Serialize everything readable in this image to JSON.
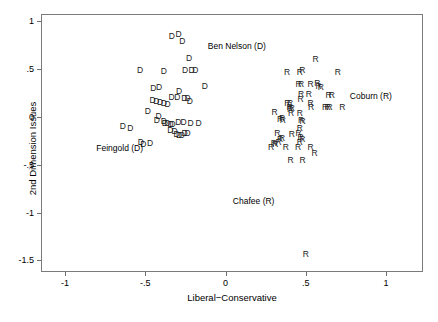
{
  "chart_data": {
    "type": "scatter",
    "title": "",
    "xlabel": "Liberal−Conservative",
    "ylabel": "2nd Dimension Issues",
    "xlim": [
      -1.15,
      1.23
    ],
    "ylim": [
      -1.62,
      1.07
    ],
    "grid": false,
    "legend": false,
    "xticks": [
      -1,
      -0.5,
      0,
      0.5,
      1
    ],
    "xticklabels": [
      "-1",
      "-.5",
      "0",
      ".5",
      "1"
    ],
    "yticks": [
      -1.5,
      -1,
      -0.5,
      0,
      0.5,
      1
    ],
    "yticklabels": [
      "-1.5",
      "-1",
      "-.5",
      "0",
      ".5",
      "1"
    ],
    "point_marker_is_text": true,
    "series": [
      {
        "name": "Democrats",
        "marker": "D",
        "color": "#1a1a1a",
        "points": [
          [
            -0.335,
            0.845
          ],
          [
            -0.293,
            0.865
          ],
          [
            -0.27,
            0.79
          ],
          [
            -0.228,
            0.61
          ],
          [
            -0.253,
            0.49
          ],
          [
            -0.212,
            0.487
          ],
          [
            -0.188,
            0.487
          ],
          [
            -0.533,
            0.487
          ],
          [
            -0.385,
            0.475
          ],
          [
            -0.13,
            0.315
          ],
          [
            -0.45,
            0.3
          ],
          [
            -0.415,
            0.313
          ],
          [
            -0.29,
            0.268
          ],
          [
            -0.337,
            0.205
          ],
          [
            -0.3,
            0.2
          ],
          [
            -0.257,
            0.192
          ],
          [
            -0.236,
            0.19
          ],
          [
            -0.222,
            0.158
          ],
          [
            -0.455,
            0.17
          ],
          [
            -0.432,
            0.16
          ],
          [
            -0.408,
            0.152
          ],
          [
            -0.385,
            0.142
          ],
          [
            -0.362,
            0.135
          ],
          [
            -0.485,
            0.06
          ],
          [
            -0.418,
            0.005
          ],
          [
            -0.428,
            -0.03
          ],
          [
            -0.385,
            -0.048
          ],
          [
            -0.378,
            -0.062
          ],
          [
            -0.363,
            -0.07
          ],
          [
            -0.343,
            -0.072
          ],
          [
            -0.33,
            -0.072
          ],
          [
            -0.295,
            -0.06
          ],
          [
            -0.262,
            -0.058
          ],
          [
            -0.218,
            -0.062
          ],
          [
            -0.168,
            -0.068
          ],
          [
            -0.64,
            -0.095
          ],
          [
            -0.593,
            -0.12
          ],
          [
            -0.345,
            -0.14
          ],
          [
            -0.318,
            -0.145
          ],
          [
            -0.305,
            -0.18
          ],
          [
            -0.29,
            -0.19
          ],
          [
            -0.272,
            -0.195
          ],
          [
            -0.255,
            -0.168
          ],
          [
            -0.237,
            -0.175
          ],
          [
            -0.528,
            -0.268
          ],
          [
            -0.512,
            -0.285
          ],
          [
            -0.47,
            -0.278
          ]
        ]
      },
      {
        "name": "Republicans",
        "marker": "R",
        "color": "#1a1a1a",
        "points": [
          [
            0.56,
            0.605
          ],
          [
            0.383,
            0.465
          ],
          [
            0.462,
            0.468
          ],
          [
            0.478,
            0.49
          ],
          [
            0.7,
            0.468
          ],
          [
            0.455,
            0.34
          ],
          [
            0.47,
            0.34
          ],
          [
            0.53,
            0.335
          ],
          [
            0.572,
            0.352
          ],
          [
            0.58,
            0.318
          ],
          [
            0.593,
            0.31
          ],
          [
            0.47,
            0.238
          ],
          [
            0.518,
            0.232
          ],
          [
            0.642,
            0.228
          ],
          [
            0.662,
            0.23
          ],
          [
            0.468,
            0.185
          ],
          [
            0.385,
            0.14
          ],
          [
            0.402,
            0.14
          ],
          [
            0.53,
            0.14
          ],
          [
            0.398,
            0.098
          ],
          [
            0.402,
            0.082
          ],
          [
            0.412,
            0.095
          ],
          [
            0.532,
            0.105
          ],
          [
            0.62,
            0.105
          ],
          [
            0.635,
            0.1
          ],
          [
            0.648,
            0.1
          ],
          [
            0.727,
            0.098
          ],
          [
            0.305,
            0.05
          ],
          [
            0.408,
            0.042
          ],
          [
            0.462,
            0.04
          ],
          [
            0.34,
            -0.02
          ],
          [
            0.352,
            -0.012
          ],
          [
            0.357,
            -0.035
          ],
          [
            0.47,
            -0.03
          ],
          [
            0.48,
            -0.05
          ],
          [
            0.462,
            -0.12
          ],
          [
            0.323,
            -0.175
          ],
          [
            0.412,
            -0.18
          ],
          [
            0.455,
            -0.17
          ],
          [
            0.34,
            -0.23
          ],
          [
            0.352,
            -0.225
          ],
          [
            0.467,
            -0.215
          ],
          [
            0.478,
            -0.232
          ],
          [
            0.462,
            -0.268
          ],
          [
            0.283,
            -0.32
          ],
          [
            0.375,
            -0.32
          ],
          [
            0.452,
            -0.318
          ],
          [
            0.53,
            -0.318
          ],
          [
            0.33,
            -0.262
          ],
          [
            0.3,
            -0.275
          ],
          [
            0.31,
            -0.288
          ],
          [
            0.555,
            -0.382
          ],
          [
            0.405,
            -0.455
          ],
          [
            0.48,
            -0.448
          ],
          [
            0.5,
            -1.435
          ]
        ]
      }
    ],
    "annotations": [
      {
        "text": "Ben Nelson (D)",
        "x": 0.07,
        "y": 0.735
      },
      {
        "text": "Coburn (R)",
        "x": 0.905,
        "y": 0.215
      },
      {
        "text": "Feingold (D)",
        "x": -0.66,
        "y": -0.325
      },
      {
        "text": "Chafee (R)",
        "x": 0.175,
        "y": -0.88
      }
    ]
  },
  "axes": {
    "x_title": "Liberal−Conservative",
    "y_title": "2nd Dimension Issues"
  }
}
